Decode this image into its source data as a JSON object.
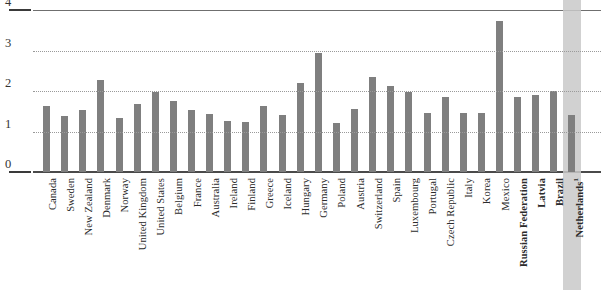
{
  "title": "",
  "chart_data": {
    "type": "bar",
    "title": "",
    "xlabel": "",
    "ylabel": "",
    "ylim": [
      0,
      4
    ],
    "yticks": [
      "0",
      "1",
      "2",
      "3",
      "4"
    ],
    "grid": "horizontal dotted gridlines at 1, 2 and 3",
    "legend": "none",
    "orientation": "vertical",
    "bar_color": "#7f7f7f",
    "highlight_color": "#c9c9c9",
    "highlight_category": "Netherlands",
    "bold_categories": [
      "Russian Federation",
      "Latvia",
      "Brazil",
      "Netherlands"
    ],
    "footnote_marker": "1",
    "categories": [
      "Canada",
      "Sweden",
      "New Zealand",
      "Denmark",
      "Norway",
      "United Kingdom",
      "United States",
      "Belgium",
      "France",
      "Australia",
      "Ireland",
      "Finland",
      "Greece",
      "Iceland",
      "Hungary",
      "Germany",
      "Poland",
      "Austria",
      "Switzerland",
      "Spain",
      "Luxembourg",
      "Portugal",
      "Czech Republic",
      "Italy",
      "Korea",
      "Mexico",
      "Russian Federation",
      "Latvia",
      "Brazil",
      "Netherlands"
    ],
    "values": [
      1.63,
      1.38,
      1.52,
      2.28,
      1.33,
      1.67,
      1.97,
      1.75,
      1.52,
      1.44,
      1.25,
      1.23,
      1.62,
      1.4,
      2.2,
      2.93,
      1.22,
      1.55,
      2.35,
      2.12,
      1.97,
      1.45,
      1.85,
      1.45,
      1.45,
      3.72,
      1.85,
      1.9,
      2.0,
      1.42
    ]
  },
  "axis": {
    "ytick_labels": [
      "0",
      "1",
      "2",
      "3",
      "4"
    ]
  }
}
